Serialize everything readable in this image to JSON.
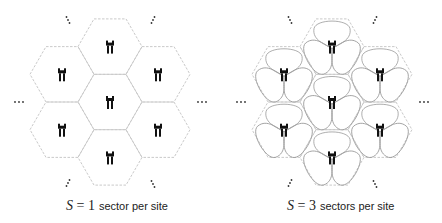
{
  "diagrams": [
    {
      "name": "single-sector",
      "sectors": 1,
      "center": [
        110,
        102
      ],
      "caption": {
        "math_var": "S",
        "eq": " = ",
        "value": "1",
        "text": "sector per site"
      }
    },
    {
      "name": "three-sector",
      "sectors": 3,
      "center": [
        332,
        102
      ],
      "caption": {
        "math_var": "S",
        "eq": " = ",
        "value": "3",
        "text": "sectors per site"
      }
    }
  ],
  "colors": {
    "hex_border": "#bbbbbb",
    "antenna": "#111111",
    "lobe": "#999999",
    "dots": "#333333"
  },
  "icons": [
    "base-station-antenna-icon",
    "ellipsis-icon"
  ]
}
